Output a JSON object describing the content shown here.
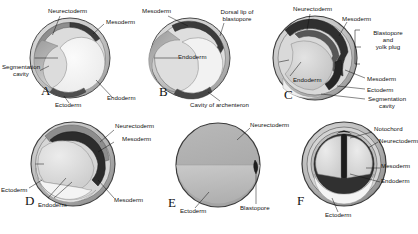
{
  "figure": {
    "type": "biological-diagram",
    "panel_count": 6,
    "rows": 2,
    "columns": 3,
    "background_color": "#ffffff",
    "ink_color": "#111111",
    "rendering": "grayscale halftone line illustration"
  },
  "terms": {
    "neurectoderm": "Neurectoderm",
    "mesoderm": "Mesoderm",
    "ectoderm": "Ectoderm",
    "endoderm": "Endoderm",
    "segmentation_cavity": "Segmentation\ncavity",
    "dorsal_lip": "Dorsal lip of\nblastopore",
    "archenteron": "Cavity of archenteron",
    "blastopore_yolk_plug": "Blastopore\nand\nyolk plug",
    "blastopore": "Blastopore",
    "notochord": "Notochord"
  },
  "panels": [
    {
      "id": "A",
      "letter": "A",
      "stage": "early gastrula, sectioned",
      "labels": [
        {
          "name": "neurectoderm",
          "text": "Neurectoderm"
        },
        {
          "name": "mesoderm",
          "text": "Mesoderm"
        },
        {
          "name": "segmentation-cavity",
          "text": "Segmentation\ncavity"
        },
        {
          "name": "ectoderm",
          "text": "Ectoderm"
        },
        {
          "name": "endoderm",
          "text": "Endoderm"
        }
      ]
    },
    {
      "id": "B",
      "letter": "B",
      "stage": "mid gastrula with crescent archenteron",
      "labels": [
        {
          "name": "mesoderm",
          "text": "Mesoderm"
        },
        {
          "name": "dorsal-lip",
          "text": "Dorsal lip of\nblastopore"
        },
        {
          "name": "endoderm",
          "text": "Endoderm"
        },
        {
          "name": "archenteron",
          "text": "Cavity of archenteron"
        }
      ]
    },
    {
      "id": "C",
      "letter": "C",
      "stage": "late gastrula with yolk plug",
      "labels": [
        {
          "name": "neurectoderm",
          "text": "Neurectoderm"
        },
        {
          "name": "mesoderm-top",
          "text": "Mesoderm"
        },
        {
          "name": "blastopore-yolk-plug",
          "text": "Blastopore\nand\nyolk plug"
        },
        {
          "name": "endoderm",
          "text": "Endoderm"
        },
        {
          "name": "mesoderm-right",
          "text": "Mesoderm"
        },
        {
          "name": "ectoderm",
          "text": "Ectoderm"
        },
        {
          "name": "segmentation-cavity",
          "text": "Segmentation\ncavity"
        }
      ]
    },
    {
      "id": "D",
      "letter": "D",
      "stage": "yolk plug stage, sectioned",
      "labels": [
        {
          "name": "neurectoderm",
          "text": "Neurectoderm"
        },
        {
          "name": "mesoderm-top",
          "text": "Mesoderm"
        },
        {
          "name": "ectoderm",
          "text": "Ectoderm"
        },
        {
          "name": "endoderm",
          "text": "Endoderm"
        },
        {
          "name": "mesoderm-right",
          "text": "Mesoderm"
        }
      ]
    },
    {
      "id": "E",
      "letter": "E",
      "stage": "external view of late gastrula",
      "labels": [
        {
          "name": "neurectoderm",
          "text": "Neurectoderm"
        },
        {
          "name": "ectoderm",
          "text": "Ectoderm"
        },
        {
          "name": "blastopore",
          "text": "Blastopore"
        }
      ]
    },
    {
      "id": "F",
      "letter": "F",
      "stage": "neurula, transverse section",
      "labels": [
        {
          "name": "notochord",
          "text": "Notochord"
        },
        {
          "name": "neurectoderm",
          "text": "Neurectoderm"
        },
        {
          "name": "mesoderm",
          "text": "Mesoderm"
        },
        {
          "name": "endoderm",
          "text": "Endoderm"
        },
        {
          "name": "ectoderm",
          "text": "Ectoderm"
        }
      ]
    }
  ],
  "footer": {
    "clipped_caption": "—"
  }
}
